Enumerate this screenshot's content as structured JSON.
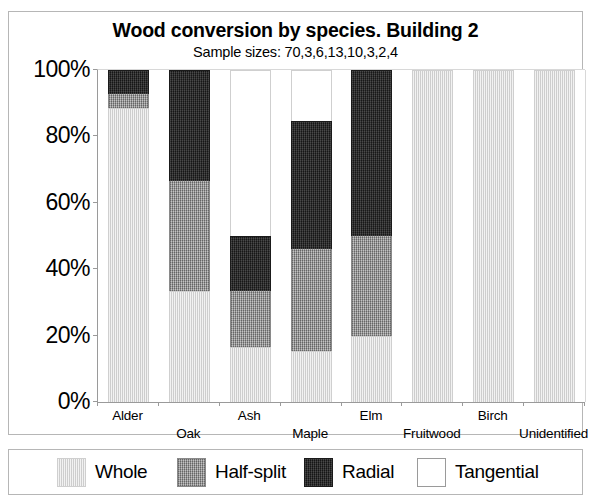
{
  "page": {
    "clipped_top_text": "",
    "background": "#ffffff"
  },
  "chart_frame": {
    "border_color": "#b6b6b6"
  },
  "legend": {
    "items": [
      {
        "label": "Whole",
        "color": "#f2f2f2",
        "swatch": "sw-whole",
        "left": 48
      },
      {
        "label": "Half-split",
        "color": "#9e9e9e",
        "swatch": "sw-half",
        "left": 168
      },
      {
        "label": "Radial",
        "color": "#262626",
        "swatch": "sw-radial",
        "left": 295
      },
      {
        "label": "Tangential",
        "color": "#ffffff",
        "swatch": "sw-tangential",
        "left": 408
      }
    ]
  },
  "chart_data": {
    "type": "bar",
    "subtype": "stacked-100-percent",
    "title": "Wood conversion by species. Building 2",
    "subtitle": "Sample sizes: 70,3,6,13,10,3,2,4",
    "xlabel": "",
    "ylabel": "",
    "ylim": [
      0,
      100
    ],
    "yticks": [
      "0%",
      "20%",
      "40%",
      "60%",
      "80%",
      "100%"
    ],
    "ytick_values": [
      0,
      20,
      40,
      60,
      80,
      100
    ],
    "grid": false,
    "legend_position": "bottom",
    "categories": [
      "Alder",
      "Oak",
      "Ash",
      "Maple",
      "Elm",
      "Fruitwood",
      "Birch",
      "Unidentified"
    ],
    "sample_sizes": [
      70,
      3,
      6,
      13,
      10,
      3,
      2,
      4
    ],
    "series": [
      {
        "name": "Whole",
        "color": "#f2f2f2",
        "values": [
          88.6,
          33.3,
          16.7,
          15.4,
          20.0,
          100.0,
          100.0,
          100.0
        ]
      },
      {
        "name": "Half-split",
        "color": "#9e9e9e",
        "values": [
          4.3,
          33.3,
          16.7,
          30.8,
          30.0,
          0.0,
          0.0,
          0.0
        ]
      },
      {
        "name": "Radial",
        "color": "#262626",
        "values": [
          7.1,
          33.3,
          16.7,
          38.5,
          50.0,
          0.0,
          0.0,
          0.0
        ]
      },
      {
        "name": "Tangential",
        "color": "#ffffff",
        "values": [
          0.0,
          0.0,
          50.0,
          15.4,
          0.0,
          0.0,
          0.0,
          0.0
        ]
      }
    ]
  }
}
